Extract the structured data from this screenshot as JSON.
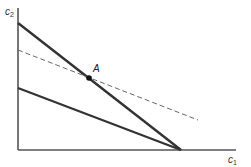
{
  "diagram": {
    "type": "budget-constraint",
    "axes": {
      "y_label": "c",
      "y_sub": "2",
      "x_label": "c",
      "x_sub": "1"
    },
    "points": [
      {
        "label": "A"
      }
    ],
    "lines": [
      {
        "name": "steep-budget-line",
        "style": "solid",
        "color": "#333333"
      },
      {
        "name": "flat-budget-line",
        "style": "solid",
        "color": "#333333"
      },
      {
        "name": "dashed-budget-line",
        "style": "dashed",
        "color": "#555555"
      }
    ],
    "colors": {
      "axis": "#555555",
      "line": "#333333",
      "dashed": "#666666",
      "point": "#111111"
    }
  }
}
